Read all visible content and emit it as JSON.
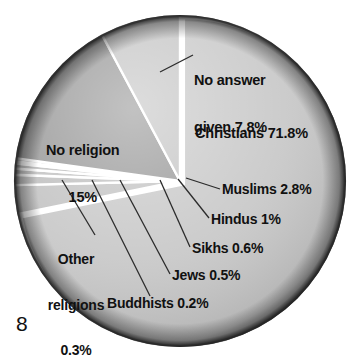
{
  "page": {
    "number": "8"
  },
  "chart_data": {
    "type": "pie",
    "title": "",
    "legend_position": "callout-labels",
    "unit": "%",
    "categories": [
      "Christians",
      "No answer given",
      "No religion",
      "Muslims",
      "Hindus",
      "Sikhs",
      "Jews",
      "Buddhists",
      "Other religions"
    ],
    "values": [
      71.8,
      7.8,
      15,
      2.8,
      1,
      0.6,
      0.5,
      0.2,
      0.3
    ],
    "slices": [
      {
        "name": "christians",
        "label": "Christians 71.8%",
        "value": 71.8,
        "color": "#c9c9c9",
        "exploded": true
      },
      {
        "name": "muslims",
        "label": "Muslims 2.8%",
        "value": 2.8,
        "color": "#c4c4c4",
        "exploded": false
      },
      {
        "name": "hindus",
        "label": "Hindus 1%",
        "value": 1.0,
        "color": "#c0c0c0",
        "exploded": false
      },
      {
        "name": "sikhs",
        "label": "Sikhs 0.6%",
        "value": 0.6,
        "color": "#c2c2c2",
        "exploded": false
      },
      {
        "name": "jews",
        "label": "Jews 0.5%",
        "value": 0.5,
        "color": "#bfbfbf",
        "exploded": false
      },
      {
        "name": "buddhists",
        "label": "Buddhists 0.2%",
        "value": 0.2,
        "color": "#c3c3c3",
        "exploded": false
      },
      {
        "name": "other-religions",
        "label": "Other religions 0.3%",
        "value": 0.3,
        "color": "#c1c1c1",
        "exploded": false
      },
      {
        "name": "no-religion",
        "label": "No religion 15%",
        "value": 15.0,
        "color": "#9a9a9a",
        "exploded": false
      },
      {
        "name": "no-answer-given",
        "label": "No answer given 7.8%",
        "value": 7.8,
        "color": "#c6c6c6",
        "exploded": false
      }
    ]
  },
  "labels": {
    "no_answer_line1": "No answer",
    "no_answer_line2": "given 7.8%",
    "christians": "Christians 71.8%",
    "no_religion_line1": "No religion",
    "no_religion_line2": "15%",
    "muslims": "Muslims 2.8%",
    "hindus": "Hindus 1%",
    "sikhs": "Sikhs 0.6%",
    "jews": "Jews 0.5%",
    "buddhists": "Buddhists 0.2%",
    "other_line1": "Other",
    "other_line2": "religions",
    "other_line3": "0.3%"
  }
}
